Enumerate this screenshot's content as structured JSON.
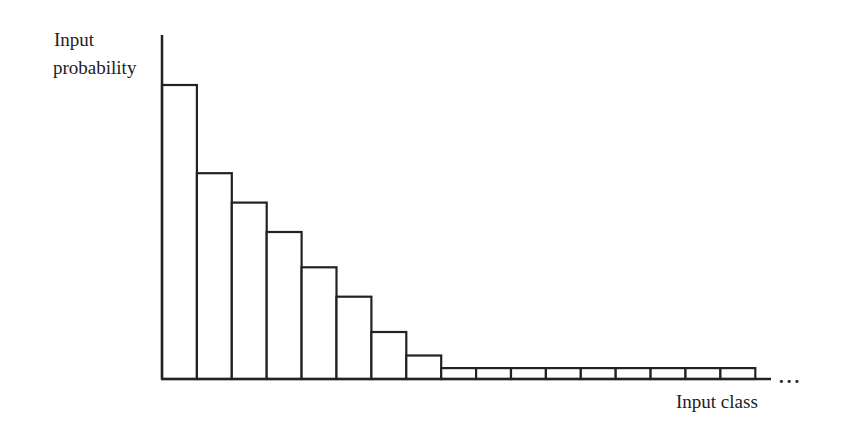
{
  "chart_data": {
    "type": "bar",
    "title": "",
    "xlabel": "Input class",
    "ylabel": "Input probability",
    "x_continuation": "...",
    "categories": [
      "1",
      "2",
      "3",
      "4",
      "5",
      "6",
      "7",
      "8",
      "9",
      "10",
      "11",
      "12",
      "13",
      "14",
      "15",
      "16",
      "17"
    ],
    "values": [
      1.0,
      0.7,
      0.6,
      0.5,
      0.38,
      0.28,
      0.16,
      0.08,
      0.037,
      0.037,
      0.037,
      0.037,
      0.037,
      0.037,
      0.037,
      0.037,
      0.037
    ],
    "value_units": "relative height (tallest bar = 1.0); no numeric axis shown",
    "ylim": [
      0,
      1.15
    ],
    "grid": false,
    "legend": null,
    "bar_fill": "#ffffff",
    "bar_stroke": "#222222"
  },
  "labels": {
    "ylabel_line1": "Input",
    "ylabel_line2": "probability",
    "xlabel": "Input class",
    "ellipsis": "..."
  }
}
